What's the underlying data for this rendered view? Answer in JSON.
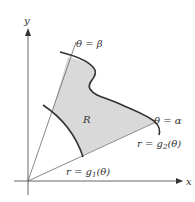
{
  "diagram": {
    "type": "polar-region",
    "axes": {
      "x_label": "x",
      "y_label": "y"
    },
    "rays": [
      {
        "id": "beta",
        "label": "θ = β"
      },
      {
        "id": "alpha",
        "label": "θ = α"
      }
    ],
    "curves": [
      {
        "id": "g1",
        "label": "r = g",
        "subscript": "1",
        "suffix": "(θ)"
      },
      {
        "id": "g2",
        "label": "r = g",
        "subscript": "2",
        "suffix": "(θ)"
      }
    ],
    "region": {
      "label": "R",
      "fill": "#d9d9d9"
    },
    "colors": {
      "line": "#333333",
      "thin_line": "#555555"
    }
  }
}
